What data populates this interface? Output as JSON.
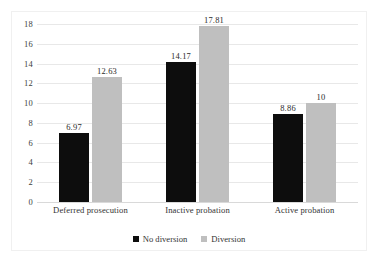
{
  "chart_data": {
    "type": "bar",
    "title": "",
    "subtitle": "",
    "xlabel": "",
    "ylabel": "",
    "categories": [
      "Deferred prosecution",
      "Inactive probation",
      "Active probation"
    ],
    "series": [
      {
        "name": "No diversion",
        "color": "#0D0D0D",
        "values": [
          6.97,
          14.17,
          8.86
        ],
        "labels": [
          "6.97",
          "14.17",
          "8.86"
        ]
      },
      {
        "name": "Diversion",
        "color": "#BFBFBF",
        "values": [
          12.63,
          17.81,
          10
        ],
        "labels": [
          "12.63",
          "17.81",
          "10"
        ]
      }
    ],
    "ylim": [
      0,
      18
    ],
    "ytick_step": 2,
    "yticks": [
      18,
      16,
      14,
      12,
      10,
      8,
      6,
      4,
      2,
      0
    ],
    "ytick_labels": [
      "18",
      "16",
      "14",
      "12",
      "10",
      "8",
      "6",
      "4",
      "2",
      "0"
    ],
    "grid": true,
    "grid_axis": "y",
    "legend_position": "bottom",
    "bar_labels_shown": true
  },
  "legend": {
    "items": [
      {
        "label": "No diversion",
        "swatch": "legend-swatch-black"
      },
      {
        "label": "Diversion",
        "swatch": "legend-swatch-gray"
      }
    ]
  },
  "colors": {
    "series_no_diversion": "#0D0D0D",
    "series_diversion": "#BFBFBF",
    "gridline": "#E8E8E8",
    "baseline": "#D9D9D9",
    "frame": "#F0F0F0",
    "text": "#333333",
    "background": "#FFFFFF"
  }
}
